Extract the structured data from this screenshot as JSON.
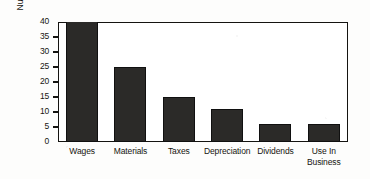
{
  "chart_data": {
    "type": "bar",
    "title": "",
    "xlabel": "",
    "ylabel": "Number of Cents Spent",
    "categories": [
      "Wages",
      "Materials",
      "Taxes",
      "Depreciation",
      "Dividends",
      "Use In Business"
    ],
    "category_lines": [
      [
        "Wages"
      ],
      [
        "Materials"
      ],
      [
        "Taxes"
      ],
      [
        "Depreciation"
      ],
      [
        "Dividends"
      ],
      [
        "Use In",
        "Business"
      ]
    ],
    "values": [
      40,
      25,
      15,
      11,
      6,
      6
    ],
    "ylim": [
      0,
      40
    ],
    "ytick_labels": [
      "40",
      "35",
      "30",
      "25",
      "20",
      "15",
      "10",
      "5",
      "0"
    ],
    "ytick_values": [
      40,
      35,
      30,
      25,
      20,
      15,
      10,
      5,
      0
    ],
    "grid": false,
    "legend": "none",
    "bar_color": "#2b2a28",
    "frame_color": "#141310",
    "background_color": "#ffffff"
  }
}
